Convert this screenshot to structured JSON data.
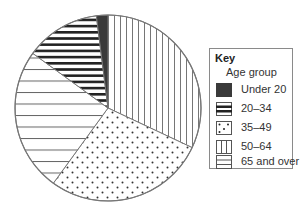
{
  "chart_data": {
    "type": "pie",
    "title": "",
    "legend": {
      "title": "Key",
      "subtitle": "Age group",
      "position": "right"
    },
    "categories": [
      "Under 20",
      "20–34",
      "35–49",
      "50–64",
      "65 and over"
    ],
    "values": [
      2,
      13,
      28,
      32,
      25
    ],
    "units": "percent (estimated)",
    "patterns": {
      "Under 20": "solid-dark",
      "20–34": "thick-horizontal-lines",
      "35–49": "dots",
      "50–64": "vertical-lines",
      "65 and over": "thin-horizontal-lines"
    },
    "slice_order_clockwise_from_top": [
      "50–64",
      "35–49",
      "65 and over",
      "20–34",
      "Under 20"
    ]
  },
  "legend": {
    "title": "Key",
    "subtitle": "Age group",
    "items": [
      {
        "label": "Under 20",
        "pattern": "solid"
      },
      {
        "label": "20–34",
        "pattern": "thickh"
      },
      {
        "label": "35–49",
        "pattern": "dots"
      },
      {
        "label": "50–64",
        "pattern": "vert"
      },
      {
        "label": "65 and over",
        "pattern": "thinh"
      }
    ]
  },
  "colors": {
    "outline": "#777777",
    "dark": "#3a3a3a",
    "line": "#555555"
  }
}
